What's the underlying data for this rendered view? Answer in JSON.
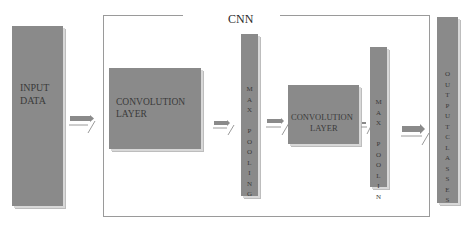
{
  "diagram": {
    "title": "CNN",
    "colors": {
      "block": "#8a8a8a",
      "frame": "#9a9a9a",
      "text": "#3a3a3a",
      "background": "#ffffff"
    },
    "blocks": [
      {
        "id": "input",
        "label_line1": "INPUT",
        "label_line2": "DATA"
      },
      {
        "id": "conv1",
        "label_line1": "CONVOLUTION",
        "label_line2": "LAYER"
      },
      {
        "id": "pool1",
        "label": "M\nA\nX\n\nP\nO\nO\nL\nI\nN\nG"
      },
      {
        "id": "conv2",
        "label_line1": "CONVOLUTION",
        "label_line2": "LAYER"
      },
      {
        "id": "pool2",
        "label": "M\nA\nX\n\nP\nO\nO\nL\nI\nN"
      },
      {
        "id": "output",
        "label": "O\nU\nT\nP\nU\nT\nC\nL\nA\nS\nS\nE\nS"
      }
    ],
    "arrows": [
      {
        "from": "input",
        "to": "conv1"
      },
      {
        "from": "conv1",
        "to": "pool1"
      },
      {
        "from": "pool1",
        "to": "conv2"
      },
      {
        "from": "conv2",
        "to": "pool2"
      },
      {
        "from": "pool2",
        "to": "output"
      }
    ]
  }
}
